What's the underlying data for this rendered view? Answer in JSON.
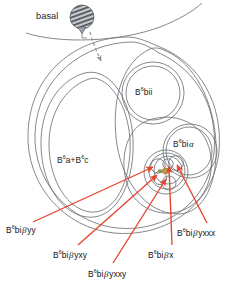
{
  "figure": {
    "type": "cell-lineage-outline-diagram",
    "background_color": "#ffffff",
    "outline_color": "#6e7377",
    "arrow_color": "#e8432a",
    "text_color": "#1a1a1a"
  },
  "annotations": {
    "basal": {
      "label": "basal",
      "icon": "hatched-sphere-pointer-icon"
    }
  },
  "region_labels": [
    {
      "id": "b6a-plus-b6c",
      "prefix": "B",
      "sup": "6",
      "rest": "a+B",
      "sup2": "6",
      "tail": "c",
      "text": "B6a+B6c"
    },
    {
      "id": "b6bii",
      "prefix": "B",
      "sup": "6",
      "rest": "bii",
      "text": "B6bii"
    },
    {
      "id": "b6bi-alpha",
      "prefix": "B",
      "sup": "6",
      "rest": "bi",
      "greek": "α",
      "text": "B6biα"
    }
  ],
  "callouts": [
    {
      "id": "b6bi-beta-yy",
      "prefix": "B",
      "sup": "6",
      "mid": "bi",
      "greek": "β",
      "suffix": "yy"
    },
    {
      "id": "b6bi-beta-yxy",
      "prefix": "B",
      "sup": "6",
      "mid": "bi",
      "greek": "β",
      "suffix": "yxy"
    },
    {
      "id": "b6bi-beta-yxxy",
      "prefix": "B",
      "sup": "6",
      "mid": "bi",
      "greek": "β",
      "suffix": "yxxy"
    },
    {
      "id": "b6bi-beta-x",
      "prefix": "B",
      "sup": "6",
      "mid": "bi",
      "greek": "β",
      "suffix": "x"
    },
    {
      "id": "b6bi-beta-yxxx",
      "prefix": "B",
      "sup": "6",
      "mid": "bi",
      "greek": "β",
      "suffix": "yxxx"
    }
  ]
}
